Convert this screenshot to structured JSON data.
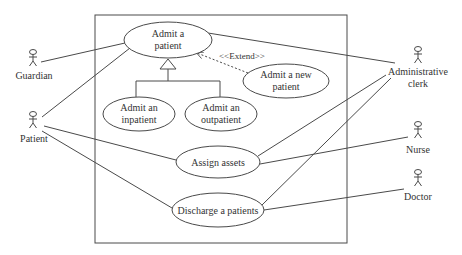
{
  "diagram": {
    "type": "UML use case diagram",
    "system_boundary": {
      "x": 95,
      "y": 15,
      "w": 252,
      "h": 228
    },
    "actors": [
      {
        "id": "guardian",
        "label": [
          "Guardian"
        ],
        "x": 33,
        "y": 50
      },
      {
        "id": "patient",
        "label": [
          "Patient"
        ],
        "x": 33,
        "y": 112
      },
      {
        "id": "admin-clerk",
        "label": [
          "Administrative",
          "clerk"
        ],
        "x": 418,
        "y": 46
      },
      {
        "id": "nurse",
        "label": [
          "Nurse"
        ],
        "x": 418,
        "y": 122
      },
      {
        "id": "doctor",
        "label": [
          "Doctor"
        ],
        "x": 418,
        "y": 170
      }
    ],
    "use_cases": [
      {
        "id": "admit-patient",
        "label": [
          "Admit a",
          "patient"
        ],
        "cx": 168,
        "cy": 40,
        "rx": 44,
        "ry": 18
      },
      {
        "id": "admit-inpatient",
        "label": [
          "Admit an",
          "inpatient"
        ],
        "cx": 139,
        "cy": 114,
        "rx": 36,
        "ry": 17
      },
      {
        "id": "admit-outpatient",
        "label": [
          "Admit an",
          "outpatient"
        ],
        "cx": 221,
        "cy": 114,
        "rx": 36,
        "ry": 17
      },
      {
        "id": "admit-new-patient",
        "label": [
          "Admit a new",
          "patient"
        ],
        "cx": 286,
        "cy": 81,
        "rx": 43,
        "ry": 17
      },
      {
        "id": "assign-assets",
        "label": [
          "Assign assets"
        ],
        "cx": 218,
        "cy": 162,
        "rx": 42,
        "ry": 16
      },
      {
        "id": "discharge-patients",
        "label": [
          "Discharge a patients"
        ],
        "cx": 218,
        "cy": 210,
        "rx": 46,
        "ry": 17
      }
    ],
    "stereotype": "<<Extend>>",
    "associations": [
      [
        "guardian",
        "admit-patient"
      ],
      [
        "patient",
        "admit-patient"
      ],
      [
        "patient",
        "assign-assets"
      ],
      [
        "patient",
        "discharge-patients"
      ],
      [
        "admin-clerk",
        "admit-patient"
      ],
      [
        "admin-clerk",
        "assign-assets"
      ],
      [
        "admin-clerk",
        "discharge-patients"
      ],
      [
        "nurse",
        "assign-assets"
      ],
      [
        "doctor",
        "discharge-patients"
      ]
    ],
    "generalizations": [
      [
        "admit-inpatient",
        "admit-patient"
      ],
      [
        "admit-outpatient",
        "admit-patient"
      ]
    ],
    "extends": [
      [
        "admit-new-patient",
        "admit-patient"
      ]
    ]
  },
  "text": {
    "guardian": "Guardian",
    "patient": "Patient",
    "admin_line1": "Administrative",
    "admin_line2": "clerk",
    "nurse": "Nurse",
    "doctor": "Doctor",
    "admit_patient_1": "Admit a",
    "admit_patient_2": "patient",
    "inpatient_1": "Admit an",
    "inpatient_2": "inpatient",
    "outpatient_1": "Admit an",
    "outpatient_2": "outpatient",
    "new_patient_1": "Admit a new",
    "new_patient_2": "patient",
    "assign_assets": "Assign assets",
    "discharge": "Discharge a patients",
    "extend": "<<Extend>>"
  }
}
